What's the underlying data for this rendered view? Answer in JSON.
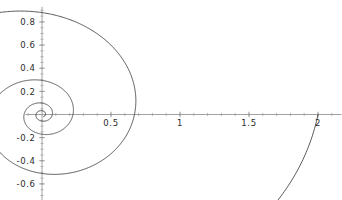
{
  "chart_data": {
    "type": "line",
    "title": "",
    "subtitle": "",
    "xlabel": "",
    "ylabel": "",
    "grid": false,
    "legend": null,
    "legend_position": "none",
    "background_color": "#ffffff",
    "curve_color": "#3a3a3a",
    "axis_color": "#8a8a8a",
    "label_color": "#2b2b2b",
    "axes_style": "mathematica-crossed-axes",
    "xlim": [
      -0.12,
      2.17
    ],
    "ylim": [
      -0.74,
      0.93
    ],
    "origin_px": {
      "x": 42.0,
      "y": 114.5
    },
    "scale_px_per_unit": {
      "x": 138.0,
      "y": 115.7
    },
    "xticks": [
      0.5,
      1,
      1.5,
      2
    ],
    "xtick_labels": [
      "0.5",
      "1",
      "1.5",
      "2"
    ],
    "yticks": [
      0.8,
      0.6,
      0.4,
      0.2,
      -0.2,
      -0.4,
      -0.6
    ],
    "ytick_labels": [
      "0.8",
      "0.6",
      "0.4",
      "0.2",
      "-0.2",
      "-0.4",
      "-0.6"
    ],
    "x_minor_tick_step": 0.1,
    "y_minor_tick_step": 0.05,
    "curve_description": "logarithmic spiral r = a*exp(b*theta) plotted in polar coordinates, converging to the origin",
    "polar_equation": "r = exp(0.17*theta)/ e^(0) scaled so outermost crossing of positive x-axis is at x = 2",
    "spiral_params": {
      "a": 2.0,
      "growth_ratio_per_turn": 0.335,
      "theta_start_deg": 0,
      "theta_end_deg": -1500,
      "direction": "clockwise-inward"
    },
    "positive_x_axis_crossings": [
      2.0,
      0.67,
      0.225,
      0.075,
      0.025,
      0.008
    ],
    "annotations": [
      {
        "text": "outer loop apex",
        "x": 1.11,
        "y": 0.84
      },
      {
        "text": "outer loop bottom",
        "x": 0.46,
        "y": -0.61
      },
      {
        "text": "second loop apex",
        "x": 0.38,
        "y": 0.455
      },
      {
        "text": "curve endpoint on x-axis",
        "x": 2.0,
        "y": 0.0
      }
    ],
    "series": [
      {
        "name": "logarithmic spiral",
        "color": "#3a3a3a",
        "points_sampled": [
          {
            "x": 2.0,
            "y": 0.0
          },
          {
            "x": 1.73,
            "y": 0.62
          },
          {
            "x": 1.11,
            "y": 0.84
          },
          {
            "x": 0.52,
            "y": 0.66
          },
          {
            "x": 0.16,
            "y": 0.3
          },
          {
            "x": 0.0,
            "y": 0.0
          },
          {
            "x": 0.12,
            "y": -0.33
          },
          {
            "x": 0.46,
            "y": -0.61
          },
          {
            "x": 0.94,
            "y": -0.45
          },
          {
            "x": 1.1,
            "y": -0.02
          },
          {
            "x": 0.86,
            "y": 0.33
          },
          {
            "x": 0.38,
            "y": 0.455
          },
          {
            "x": 0.07,
            "y": 0.22
          },
          {
            "x": 0.0,
            "y": 0.0
          },
          {
            "x": 0.09,
            "y": -0.2
          },
          {
            "x": 0.3,
            "y": -0.31
          },
          {
            "x": 0.56,
            "y": -0.14
          },
          {
            "x": 0.5,
            "y": 0.1
          },
          {
            "x": 0.28,
            "y": 0.23
          },
          {
            "x": 0.05,
            "y": 0.1
          },
          {
            "x": 0.0,
            "y": 0.0
          },
          {
            "x": 0.07,
            "y": -0.09
          },
          {
            "x": 0.17,
            "y": -0.08
          },
          {
            "x": 0.19,
            "y": 0.03
          },
          {
            "x": 0.1,
            "y": 0.09
          },
          {
            "x": 0.01,
            "y": 0.03
          },
          {
            "x": 0.0,
            "y": 0.0
          }
        ]
      }
    ]
  },
  "plot": {
    "alt": "Polar plot of a logarithmic spiral spiralling inward to the origin"
  }
}
